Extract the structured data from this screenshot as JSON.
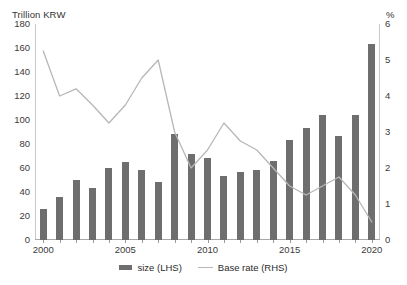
{
  "chart_data": {
    "type": "bar",
    "title": "",
    "xlabel": "",
    "ylabel": "Trillion KRW",
    "y2label": "%",
    "ylim": [
      0,
      180
    ],
    "y2lim": [
      0,
      6
    ],
    "grid": false,
    "legend_position": "bottom",
    "categories": [
      "2000",
      "2001",
      "2002",
      "2003",
      "2004",
      "2005",
      "2006",
      "2007",
      "2008",
      "2009",
      "2010",
      "2011",
      "2012",
      "2013",
      "2014",
      "2015",
      "2016",
      "2017",
      "2018",
      "2019",
      "2020"
    ],
    "series": [
      {
        "name": "size (LHS)",
        "type": "bar",
        "axis": "left",
        "color": "#6e6e6e",
        "values": [
          26,
          36,
          50,
          43,
          60,
          65,
          58,
          48,
          88,
          72,
          68,
          53,
          57,
          58,
          66,
          83,
          93,
          104,
          87,
          104,
          163
        ]
      },
      {
        "name": "Base rate (RHS)",
        "type": "line",
        "axis": "right",
        "color": "#b7b7b7",
        "values": [
          5.25,
          4.0,
          4.2,
          3.75,
          3.25,
          3.75,
          4.5,
          5.0,
          3.0,
          2.0,
          2.5,
          3.25,
          2.75,
          2.5,
          2.0,
          1.5,
          1.25,
          1.5,
          1.75,
          1.25,
          0.5
        ]
      }
    ],
    "y_ticks_left": [
      180,
      160,
      140,
      120,
      100,
      80,
      60,
      40,
      20,
      0
    ],
    "y_ticks_right": [
      6,
      5,
      4,
      3,
      2,
      1,
      0
    ],
    "x_tick_labels": [
      "2000",
      "2005",
      "2010",
      "2015",
      "2020"
    ],
    "x_tick_label_indices": [
      0,
      5,
      10,
      15,
      20
    ]
  },
  "legend": {
    "items": [
      {
        "label": "size (LHS)",
        "marker": "bar-swatch"
      },
      {
        "label": "Base rate (RHS)",
        "marker": "line-swatch"
      }
    ]
  }
}
